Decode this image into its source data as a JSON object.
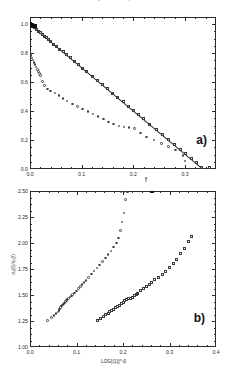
{
  "figure": {
    "cut_caption_text": "a cross is shown for clarity for comparison",
    "background": "#ffffff",
    "ink": "#2b2b2b"
  },
  "chart_data": [
    {
      "id": "panel-a",
      "type": "scatter",
      "panel_label": "a)",
      "title": "",
      "xlabel": "f",
      "ylabel": "",
      "xlim": [
        0.0,
        0.36
      ],
      "ylim": [
        0.0,
        1.05
      ],
      "xticks": [
        0.0,
        0.1,
        0.2,
        0.3
      ],
      "xticklabels": [
        "0.0",
        "0.1",
        "0.2",
        "0.3"
      ],
      "yticks": [
        0.0,
        0.2,
        0.4,
        0.6,
        0.8,
        1.0
      ],
      "yticklabels": [
        "0.0",
        "0.2",
        "0.4",
        "0.6",
        "0.8",
        "1.0"
      ],
      "xminor_per_interval": 5,
      "yminor_per_interval": 4,
      "grid": false,
      "legend_position": "none",
      "annotations": [
        {
          "text": "a)",
          "x": 0.31,
          "y": 0.2
        }
      ],
      "fit_line": {
        "label": "linear fit",
        "x": [
          0.0,
          0.335
        ],
        "y": [
          1.0,
          0.0
        ],
        "style": "solid"
      },
      "series": [
        {
          "name": "upper branch (squares, on fit line)",
          "marker": "square-open",
          "x": [
            0.0,
            0.004,
            0.008,
            0.012,
            0.016,
            0.02,
            0.024,
            0.028,
            0.032,
            0.036,
            0.04,
            0.046,
            0.052,
            0.058,
            0.064,
            0.07,
            0.078,
            0.086,
            0.094,
            0.102,
            0.11,
            0.12,
            0.13,
            0.14,
            0.15,
            0.16,
            0.17,
            0.18,
            0.19,
            0.2,
            0.21,
            0.22,
            0.232,
            0.244,
            0.256,
            0.268,
            0.28,
            0.292,
            0.3,
            0.312,
            0.322,
            0.332,
            0.348
          ],
          "y": [
            1.0,
            0.988,
            0.976,
            0.964,
            0.952,
            0.94,
            0.928,
            0.917,
            0.905,
            0.893,
            0.881,
            0.863,
            0.845,
            0.827,
            0.809,
            0.791,
            0.767,
            0.744,
            0.72,
            0.696,
            0.672,
            0.642,
            0.613,
            0.583,
            0.553,
            0.524,
            0.494,
            0.464,
            0.435,
            0.405,
            0.375,
            0.346,
            0.31,
            0.274,
            0.239,
            0.203,
            0.167,
            0.132,
            0.108,
            0.072,
            0.043,
            0.013,
            0.008
          ]
        },
        {
          "name": "lower branch (small circles)",
          "marker": "circle-open",
          "x": [
            0.0,
            0.002,
            0.004,
            0.006,
            0.008,
            0.01,
            0.012,
            0.014,
            0.016,
            0.018,
            0.02,
            0.024,
            0.028,
            0.034,
            0.04,
            0.048,
            0.056,
            0.064,
            0.072,
            0.082,
            0.092,
            0.102,
            0.112,
            0.122,
            0.132,
            0.142,
            0.152,
            0.162,
            0.172,
            0.182,
            0.192,
            0.202,
            0.214,
            0.226,
            0.24,
            0.254,
            0.268,
            0.282,
            0.296,
            0.3
          ],
          "y": [
            0.795,
            0.782,
            0.768,
            0.752,
            0.736,
            0.72,
            0.704,
            0.688,
            0.672,
            0.658,
            0.644,
            0.604,
            0.576,
            0.552,
            0.54,
            0.524,
            0.506,
            0.488,
            0.47,
            0.45,
            0.432,
            0.414,
            0.396,
            0.38,
            0.362,
            0.344,
            0.326,
            0.312,
            0.298,
            0.29,
            0.286,
            0.28,
            0.25,
            0.222,
            0.2,
            0.176,
            0.156,
            0.132,
            0.095,
            0.055
          ]
        },
        {
          "name": "filled origin cluster (solid)",
          "marker": "square-filled",
          "x": [
            0.0,
            0.003,
            0.006,
            0.009
          ],
          "y": [
            1.0,
            0.995,
            0.99,
            0.985
          ]
        }
      ]
    },
    {
      "id": "panel-b",
      "type": "scatter",
      "panel_label": "b)",
      "title": "",
      "xlabel": "LOG[(1)]^-β",
      "ylabel": "σ₀(0)/σ₀(f)",
      "xlim": [
        0.0,
        0.4
      ],
      "ylim": [
        1.0,
        2.5
      ],
      "xticks": [
        0.0,
        0.1,
        0.2,
        0.3,
        0.4
      ],
      "xticklabels": [
        "0.0",
        "0.1",
        "0.2",
        "0.3",
        "0.4"
      ],
      "yticks": [
        1.0,
        1.25,
        1.5,
        1.75,
        2.0,
        2.25,
        2.5
      ],
      "yticklabels": [
        "1.00",
        "1.25",
        "1.50",
        "1.75",
        "2.00",
        "2.25",
        "2.50"
      ],
      "xminor_per_interval": 5,
      "yminor_per_interval": 4,
      "grid": false,
      "legend_position": "none",
      "annotations": [
        {
          "text": "b)",
          "x": 0.318,
          "y": 1.21
        }
      ],
      "series": [
        {
          "name": "left branch (circles)",
          "marker": "circle-open",
          "x": [
            0.038,
            0.046,
            0.052,
            0.056,
            0.06,
            0.062,
            0.064,
            0.066,
            0.068,
            0.07,
            0.072,
            0.074,
            0.076,
            0.078,
            0.08,
            0.083,
            0.086,
            0.089,
            0.092,
            0.096,
            0.1,
            0.104,
            0.108,
            0.112,
            0.116,
            0.12,
            0.126,
            0.132,
            0.138,
            0.144,
            0.15,
            0.156,
            0.162,
            0.168,
            0.174,
            0.18,
            0.186,
            0.19,
            0.194,
            0.198,
            0.202,
            0.206,
            0.21
          ],
          "y": [
            1.255,
            1.285,
            1.305,
            1.32,
            1.335,
            1.35,
            1.365,
            1.38,
            1.395,
            1.405,
            1.415,
            1.425,
            1.435,
            1.445,
            1.455,
            1.468,
            1.48,
            1.492,
            1.505,
            1.52,
            1.54,
            1.56,
            1.58,
            1.6,
            1.62,
            1.64,
            1.668,
            1.7,
            1.73,
            1.76,
            1.79,
            1.82,
            1.855,
            1.89,
            1.925,
            1.96,
            2.0,
            2.05,
            2.12,
            2.2,
            2.29,
            2.42,
            2.49
          ]
        },
        {
          "name": "right branch (squares)",
          "marker": "square-open",
          "x": [
            0.145,
            0.152,
            0.158,
            0.163,
            0.168,
            0.172,
            0.176,
            0.18,
            0.184,
            0.188,
            0.192,
            0.196,
            0.2,
            0.204,
            0.208,
            0.212,
            0.216,
            0.22,
            0.224,
            0.228,
            0.232,
            0.238,
            0.244,
            0.25,
            0.256,
            0.262,
            0.268,
            0.276,
            0.284,
            0.292,
            0.3,
            0.308,
            0.316,
            0.324,
            0.332,
            0.34,
            0.348
          ],
          "y": [
            1.255,
            1.275,
            1.295,
            1.31,
            1.325,
            1.34,
            1.352,
            1.365,
            1.378,
            1.39,
            1.402,
            1.418,
            1.432,
            1.445,
            1.455,
            1.462,
            1.47,
            1.48,
            1.492,
            1.505,
            1.518,
            1.54,
            1.56,
            1.58,
            1.602,
            1.625,
            1.648,
            1.672,
            1.7,
            1.73,
            1.76,
            1.8,
            1.845,
            1.895,
            1.95,
            2.01,
            2.065
          ]
        },
        {
          "name": "top-axis marker (filled)",
          "marker": "square-filled",
          "x": [
            0.262
          ],
          "y": [
            2.5
          ]
        },
        {
          "name": "near-ceiling points",
          "marker": "circle-open",
          "x": [
            0.196,
            0.202,
            0.208
          ],
          "y": [
            2.495,
            2.498,
            2.5
          ]
        }
      ]
    }
  ]
}
